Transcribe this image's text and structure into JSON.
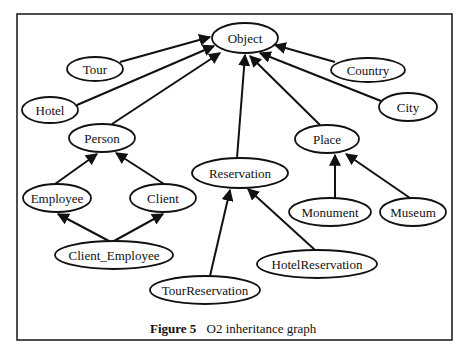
{
  "figure": {
    "caption_label": "Figure 5",
    "caption_text": "O2 inheritance graph"
  },
  "nodes": {
    "object": {
      "label": "Object",
      "cx": 245,
      "cy": 38,
      "rx": 33,
      "ry": 15
    },
    "tour": {
      "label": "Tour",
      "cx": 95,
      "cy": 69,
      "rx": 28,
      "ry": 12
    },
    "hotel": {
      "label": "Hotel",
      "cx": 50,
      "cy": 110,
      "rx": 28,
      "ry": 13
    },
    "person": {
      "label": "Person",
      "cx": 102,
      "cy": 138,
      "rx": 33,
      "ry": 14
    },
    "country": {
      "label": "Country",
      "cx": 368,
      "cy": 70,
      "rx": 37,
      "ry": 12
    },
    "city": {
      "label": "City",
      "cx": 408,
      "cy": 107,
      "rx": 29,
      "ry": 14
    },
    "place": {
      "label": "Place",
      "cx": 327,
      "cy": 139,
      "rx": 32,
      "ry": 14
    },
    "reservation": {
      "label": "Reservation",
      "cx": 240,
      "cy": 173,
      "rx": 48,
      "ry": 15
    },
    "employee": {
      "label": "Employee",
      "cx": 57,
      "cy": 198,
      "rx": 34,
      "ry": 14
    },
    "client": {
      "label": "Client",
      "cx": 163,
      "cy": 198,
      "rx": 33,
      "ry": 14
    },
    "client_employee": {
      "label": "Client_Employee",
      "cx": 114,
      "cy": 255,
      "rx": 59,
      "ry": 14
    },
    "monument": {
      "label": "Monument",
      "cx": 330,
      "cy": 212,
      "rx": 41,
      "ry": 14
    },
    "museum": {
      "label": "Museum",
      "cx": 413,
      "cy": 212,
      "rx": 33,
      "ry": 14
    },
    "hotel_reservation": {
      "label": "HotelReservation",
      "cx": 317,
      "cy": 264,
      "rx": 60,
      "ry": 14
    },
    "tour_reservation": {
      "label": "TourReservation",
      "cx": 205,
      "cy": 290,
      "rx": 55,
      "ry": 14
    }
  },
  "edges": [
    {
      "from": "Tour",
      "to": "Object"
    },
    {
      "from": "Hotel",
      "to": "Object"
    },
    {
      "from": "Person",
      "to": "Object"
    },
    {
      "from": "Reservation",
      "to": "Object"
    },
    {
      "from": "Place",
      "to": "Object"
    },
    {
      "from": "City",
      "to": "Object"
    },
    {
      "from": "Country",
      "to": "Object"
    },
    {
      "from": "Employee",
      "to": "Person"
    },
    {
      "from": "Client",
      "to": "Person"
    },
    {
      "from": "Client_Employee",
      "to": "Employee"
    },
    {
      "from": "Client_Employee",
      "to": "Client"
    },
    {
      "from": "TourReservation",
      "to": "Reservation"
    },
    {
      "from": "HotelReservation",
      "to": "Reservation"
    },
    {
      "from": "Monument",
      "to": "Place"
    },
    {
      "from": "Museum",
      "to": "Place"
    }
  ]
}
